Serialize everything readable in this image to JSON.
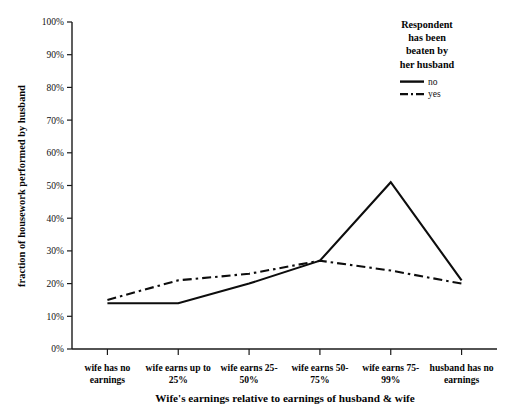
{
  "chart_data": {
    "type": "line",
    "title": "",
    "xlabel": "Wife's earnings relative to earnings of husband & wife",
    "ylabel": "fraction of housework performed by husband",
    "categories": [
      "wife has no earnings",
      "wife earns up to 25%",
      "wife earns 25-50%",
      "wife earns 50-75%",
      "wife earns 75-99%",
      "husband has no earnings"
    ],
    "category_lines": [
      [
        "wife has no",
        "earnings"
      ],
      [
        "wife earns up to",
        "25%"
      ],
      [
        "wife earns 25-",
        "50%"
      ],
      [
        "wife earns 50-",
        "75%"
      ],
      [
        "wife earns 75-",
        "99%"
      ],
      [
        "husband has no",
        "earnings"
      ]
    ],
    "series": [
      {
        "name": "no",
        "style": "solid",
        "values": [
          14,
          14,
          20,
          27,
          51,
          21
        ]
      },
      {
        "name": "yes",
        "style": "dashed",
        "values": [
          15,
          21,
          23,
          27,
          24,
          20
        ]
      }
    ],
    "ylim": [
      0,
      100
    ],
    "ytick_values": [
      0,
      10,
      20,
      30,
      40,
      50,
      60,
      70,
      80,
      90,
      100
    ],
    "ytick_labels": [
      "0%",
      "10%",
      "20%",
      "30%",
      "40%",
      "50%",
      "60%",
      "70%",
      "80%",
      "90%",
      "100%"
    ],
    "grid": false,
    "legend_position": "top-right"
  },
  "legend": {
    "title_lines": [
      "Respondent",
      "has been",
      "beaten by",
      "her husband"
    ],
    "title": "Respondent has been beaten by her husband",
    "entries": [
      {
        "label": "no",
        "style": "solid"
      },
      {
        "label": "yes",
        "style": "dashed"
      }
    ]
  }
}
